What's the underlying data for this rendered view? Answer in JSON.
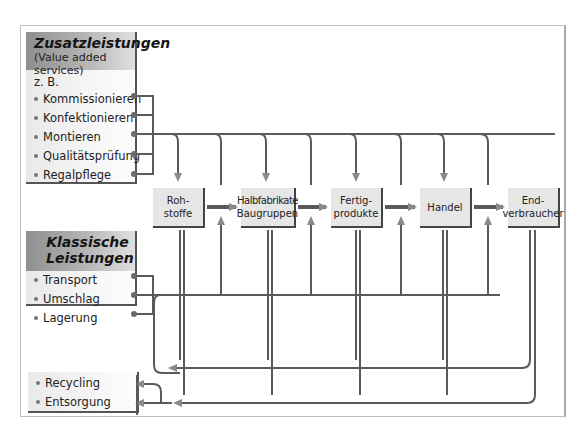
{
  "value_added": {
    "title": "Zusatzleistungen",
    "subtitle": "(Value added services)",
    "prefix": "z. B.",
    "items": [
      "Kommissionieren",
      "Konfektionieren",
      "Montieren",
      "Qualitätsprüfung",
      "Regalpflege"
    ]
  },
  "classic": {
    "title_line1": "Klassische",
    "title_line2": "Leistungen",
    "items": [
      "Transport",
      "Umschlag",
      "Lagerung"
    ]
  },
  "disposal": {
    "items": [
      "Recycling",
      "Entsorgung"
    ]
  },
  "stages": [
    {
      "line1": "Roh-",
      "line2": "stoffe"
    },
    {
      "line1": "Halbfabrikate",
      "line2": "Baugruppen"
    },
    {
      "line1": "Fertig-",
      "line2": "produkte"
    },
    {
      "line1": "Handel",
      "line2": ""
    },
    {
      "line1": "End-",
      "line2": "verbraucher"
    }
  ],
  "colors": {
    "line": "#5a5a5a",
    "arrow": "#8a8a8a",
    "box": "#e6e6e6",
    "header_dark": "#8f8f8f"
  }
}
